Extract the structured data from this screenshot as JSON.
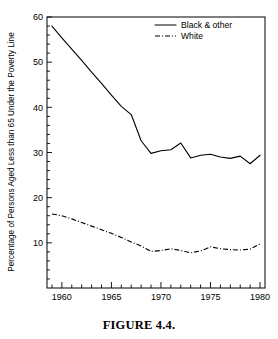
{
  "figure": {
    "caption": "FIGURE 4.4."
  },
  "chart_data": {
    "type": "line",
    "title": "",
    "xlabel": "",
    "ylabel": "Percentage of Persons Aged Less than 65 Under the Poverty Line",
    "xlim": [
      1958.5,
      1980.5
    ],
    "ylim": [
      0,
      60
    ],
    "xticks": [
      1960,
      1965,
      1970,
      1975,
      1980
    ],
    "xtick_labels": [
      "1960",
      "1965",
      "1970",
      "1975",
      "1980"
    ],
    "xminor_step": 1,
    "yticks": [
      10,
      20,
      30,
      40,
      50,
      60
    ],
    "ytick_labels": [
      "10",
      "20",
      "30",
      "40",
      "50",
      "60"
    ],
    "yminor_step": 2,
    "grid": false,
    "legend_position": "top-right",
    "x": [
      1959,
      1960,
      1961,
      1962,
      1963,
      1964,
      1965,
      1966,
      1967,
      1968,
      1969,
      1970,
      1971,
      1972,
      1973,
      1974,
      1975,
      1976,
      1977,
      1978,
      1979,
      1980
    ],
    "series": [
      {
        "name": "Black & other",
        "style": "solid",
        "color": "#000000",
        "values": [
          58.0,
          55.4,
          52.9,
          50.4,
          47.8,
          45.3,
          42.7,
          40.2,
          38.4,
          32.6,
          29.8,
          30.4,
          30.6,
          32.1,
          28.8,
          29.4,
          29.6,
          29.0,
          28.7,
          29.2,
          27.5,
          29.4
        ]
      },
      {
        "name": "White",
        "style": "dash-dot",
        "color": "#000000",
        "values": [
          16.4,
          16.0,
          15.3,
          14.5,
          13.7,
          12.9,
          12.1,
          11.2,
          10.2,
          9.3,
          8.1,
          8.3,
          8.7,
          8.3,
          7.8,
          8.2,
          9.1,
          8.7,
          8.5,
          8.4,
          8.6,
          9.8
        ]
      }
    ]
  },
  "legend": {
    "items": [
      {
        "label": "Black & other",
        "style": "solid"
      },
      {
        "label": "White",
        "style": "dash-dot"
      }
    ]
  }
}
